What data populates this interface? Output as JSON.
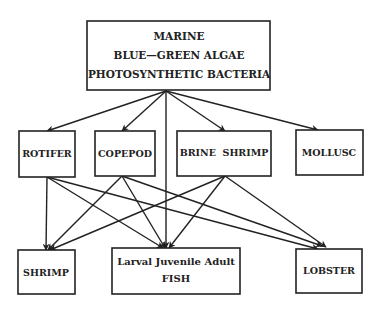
{
  "nodes": {
    "marine": {
      "lines": [
        "MARINE",
        "BLUE—GREEN ALGAE",
        "PHOTOSYNTHETIC BACTERIA"
      ]
    },
    "rotifer": {
      "lines": [
        "ROTIFER"
      ]
    },
    "copepod": {
      "lines": [
        "COPEPOD"
      ]
    },
    "brine_shrimp": {
      "lines": [
        "BRINE  SHRIMP"
      ]
    },
    "mollusc": {
      "lines": [
        "MOLLUSC"
      ]
    },
    "shrimp": {
      "lines": [
        "SHRIMP"
      ]
    },
    "fish": {
      "lines": [
        "Larval Juvenile Adult",
        "FISH"
      ]
    },
    "lobster": {
      "lines": [
        "LOBSTER"
      ]
    }
  },
  "edges": [
    {
      "from": "marine",
      "to": "rotifer"
    },
    {
      "from": "marine",
      "to": "copepod"
    },
    {
      "from": "marine",
      "to": "fish"
    },
    {
      "from": "marine",
      "to": "brine_shrimp"
    },
    {
      "from": "marine",
      "to": "mollusc"
    },
    {
      "from": "rotifer",
      "to": "shrimp"
    },
    {
      "from": "rotifer",
      "to": "fish"
    },
    {
      "from": "rotifer",
      "to": "lobster"
    },
    {
      "from": "copepod",
      "to": "shrimp"
    },
    {
      "from": "copepod",
      "to": "fish"
    },
    {
      "from": "copepod",
      "to": "lobster"
    },
    {
      "from": "brine_shrimp",
      "to": "shrimp"
    },
    {
      "from": "brine_shrimp",
      "to": "fish"
    },
    {
      "from": "brine_shrimp",
      "to": "lobster"
    }
  ],
  "colors": {
    "stroke": "#222222",
    "background": "#ffffff"
  }
}
